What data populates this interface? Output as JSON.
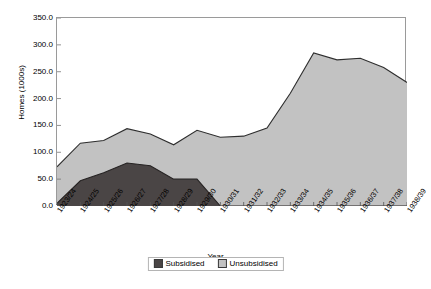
{
  "chart_data": {
    "type": "area",
    "title": "",
    "xlabel": "Year",
    "ylabel": "Homes (1000s)",
    "ylim": [
      0,
      350
    ],
    "ytick_step": 50,
    "grid": false,
    "stacked": true,
    "legend_position": "bottom",
    "categories": [
      "1923/24",
      "1924/25",
      "1925/26",
      "1926/27",
      "1927/28",
      "1928/29",
      "1929/30",
      "1930/31",
      "1931/32",
      "1932/33",
      "1933/34",
      "1934/35",
      "1935/36",
      "1936/37",
      "1937/38",
      "1938/39"
    ],
    "series": [
      {
        "name": "Subsidised",
        "color": "#4a4545",
        "values": [
          5,
          47,
          62,
          80,
          75,
          50,
          50,
          0,
          0,
          0,
          0,
          0,
          0,
          0,
          0,
          0
        ]
      },
      {
        "name": "Unsubsidised",
        "color": "#c2c2c2",
        "values": [
          68,
          70,
          60,
          64,
          59,
          64,
          91,
          128,
          130,
          145,
          210,
          285,
          272,
          275,
          258,
          230
        ]
      }
    ],
    "totals": [
      73,
      117,
      122,
      144,
      134,
      114,
      141,
      128,
      130,
      145,
      210,
      285,
      272,
      275,
      258,
      230
    ],
    "ytick_labels": [
      "350.0",
      "300.0",
      "250.0",
      "200.0",
      "150.0",
      "100.0",
      "50.0",
      "0.0"
    ],
    "ytick_values": [
      350,
      300,
      250,
      200,
      150,
      100,
      50,
      0
    ]
  },
  "axes": {
    "y_title": "Homes (1000s)",
    "x_title": "Year"
  },
  "legend": {
    "items": [
      {
        "label": "Subsidised",
        "color": "#4a4545"
      },
      {
        "label": "Unsubsidised",
        "color": "#c2c2c2"
      }
    ]
  },
  "caption": {
    "text": ""
  }
}
